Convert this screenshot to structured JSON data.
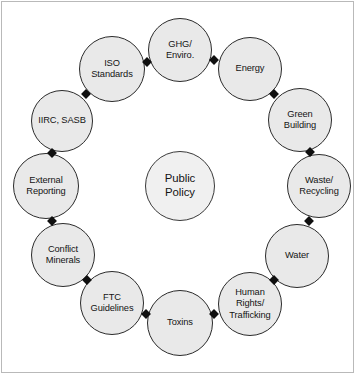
{
  "diagram": {
    "center": {
      "label": "Public\nPolicy",
      "cx": 180,
      "cy": 186,
      "r": 35
    },
    "style": {
      "node_fill": "#e9e9e9",
      "node_stroke": "#2b2b2b",
      "center_fill": "#f0f0f0",
      "center_stroke": "#3a3a3a",
      "connector_color": "#101010",
      "background": "#ffffff",
      "frame_stroke": "#b9b9b9",
      "text_color": "#141414"
    },
    "nodes": [
      {
        "label": "GHG/\nEnviro.",
        "cx": 180,
        "cy": 50,
        "r": 32
      },
      {
        "label": "Energy",
        "cx": 250,
        "cy": 69,
        "r": 32
      },
      {
        "label": "Green\nBuilding",
        "cx": 300,
        "cy": 120,
        "r": 32
      },
      {
        "label": "Waste/\nRecycling",
        "cx": 319,
        "cy": 186,
        "r": 32
      },
      {
        "label": "Water",
        "cx": 297,
        "cy": 256,
        "r": 32
      },
      {
        "label": "Human\nRights/\nTrafficking",
        "cx": 250,
        "cy": 304,
        "r": 32
      },
      {
        "label": "Toxins",
        "cx": 180,
        "cy": 323,
        "r": 33
      },
      {
        "label": "FTC\nGuidelines",
        "cx": 112,
        "cy": 303,
        "r": 32
      },
      {
        "label": "Conflict\nMinerals",
        "cx": 63,
        "cy": 255,
        "r": 32
      },
      {
        "label": "External\nReporting",
        "cx": 46,
        "cy": 186,
        "r": 33
      },
      {
        "label": "IIRC, SASB",
        "cx": 62,
        "cy": 121,
        "r": 31
      },
      {
        "label": "ISO\nStandards",
        "cx": 112,
        "cy": 69,
        "r": 33
      }
    ],
    "connectors": [
      {
        "x": 147,
        "y": 62
      },
      {
        "x": 214,
        "y": 60
      },
      {
        "x": 274,
        "y": 94
      },
      {
        "x": 310,
        "y": 152
      },
      {
        "x": 309,
        "y": 221
      },
      {
        "x": 274,
        "y": 280
      },
      {
        "x": 214,
        "y": 314
      },
      {
        "x": 146,
        "y": 314
      },
      {
        "x": 87,
        "y": 280
      },
      {
        "x": 52,
        "y": 221
      },
      {
        "x": 52,
        "y": 153
      },
      {
        "x": 86,
        "y": 94
      }
    ]
  }
}
